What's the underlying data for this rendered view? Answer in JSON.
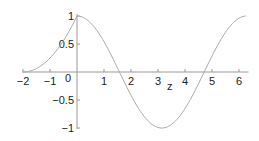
{
  "chart_data": {
    "type": "line",
    "title": "",
    "xlabel": "z",
    "ylabel": "",
    "xlim": [
      -2,
      6.28
    ],
    "ylim": [
      -1,
      1
    ],
    "grid": false,
    "legend": null,
    "x_ticks": [
      -2,
      -1,
      0,
      1,
      2,
      3,
      4,
      5,
      6
    ],
    "x_tick_labels": [
      "−2",
      "−1",
      "0",
      "1",
      "2",
      "3",
      "4",
      "5",
      "6"
    ],
    "y_ticks": [
      -1,
      -0.5,
      0.5,
      1
    ],
    "y_tick_labels": [
      "−1",
      "−0.5",
      "0.5",
      "1"
    ],
    "series": [
      {
        "name": "f(z)",
        "description": "piecewise: ((z+2)/2)^2 for -2<=z<0, cos(z) for 0<=z<=2π",
        "x": [
          -2,
          -1.5,
          -1,
          -0.5,
          0,
          0.5,
          1,
          1.5,
          1.571,
          2,
          2.5,
          3,
          3.1416,
          3.5,
          4,
          4.5,
          4.712,
          5,
          5.5,
          6,
          6.28
        ],
        "y": [
          0,
          0.06,
          0.25,
          0.56,
          1,
          0.88,
          0.54,
          0.07,
          0,
          -0.42,
          -0.8,
          -0.99,
          -1,
          -0.94,
          -0.65,
          -0.21,
          0,
          0.28,
          0.71,
          0.96,
          1
        ]
      }
    ],
    "colors": {
      "curve": "#aaaaaa",
      "axis": "#999999",
      "text": "#222222"
    }
  }
}
